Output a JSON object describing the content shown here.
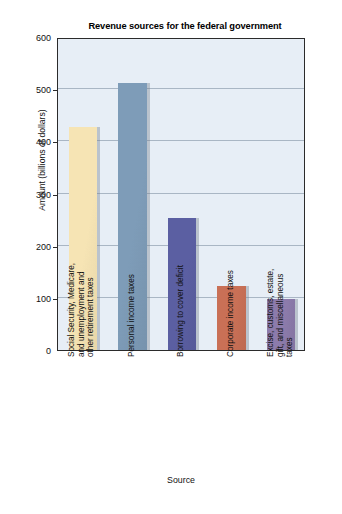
{
  "chart_data": {
    "type": "bar",
    "title": "Revenue sources for the federal government",
    "xlabel": "Source",
    "ylabel": "Amount (billions of dollars)",
    "ylim": [
      0,
      600
    ],
    "ytick_values": [
      0,
      100,
      200,
      300,
      400,
      500,
      600
    ],
    "ytick_labels": [
      "0",
      "100",
      "200",
      "300",
      "400",
      "500",
      "600"
    ],
    "grid": true,
    "legend": "none",
    "categories": [
      "Social Security, Medicare, and unemployment and other retirement taxes",
      "Personal income taxes",
      "Borrowing to cover deficit",
      "Corporate income taxes",
      "Excise, customs, estate, gift, and miscellaneous taxes"
    ],
    "category_lines": [
      [
        "Social Security, Medicare,",
        "and unemployment and",
        "other retirement taxes"
      ],
      [
        "Personal income taxes"
      ],
      [
        "Borrowing to cover deficit"
      ],
      [
        "Corporate income taxes"
      ],
      [
        "Excise, customs, estate,",
        "gift, and miscellaneous",
        "taxes"
      ]
    ],
    "values": [
      428,
      512,
      253,
      122,
      98
    ],
    "bar_colors": [
      "#f6e4b4",
      "#7e9cb8",
      "#5b5fa2",
      "#c97056",
      "#8c7bab"
    ],
    "plot_background": "#e7eef6",
    "frame_color": "#2b2b2b",
    "gridline_color": "#a9b6c4"
  }
}
